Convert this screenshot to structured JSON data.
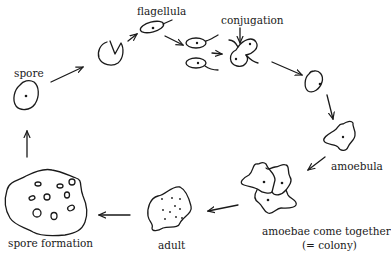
{
  "diagram": {
    "type": "life-cycle",
    "ink_color": "#1a1a1a",
    "background": "#ffffff",
    "stages": [
      {
        "id": "spore",
        "label": "spore"
      },
      {
        "id": "opening-spore",
        "label": ""
      },
      {
        "id": "flagellula",
        "label": "flagellula"
      },
      {
        "id": "conjugation",
        "label": "conjugation"
      },
      {
        "id": "zygote",
        "label": ""
      },
      {
        "id": "amoebula",
        "label": "amoebula"
      },
      {
        "id": "colony",
        "label": "amoebae come together",
        "sublabel": "(= colony)"
      },
      {
        "id": "adult",
        "label": "adult"
      },
      {
        "id": "spore-formation",
        "label": "spore formation"
      }
    ],
    "flow": [
      "spore",
      "opening-spore",
      "flagellula",
      "conjugation",
      "zygote",
      "amoebula",
      "colony",
      "adult",
      "spore-formation",
      "spore"
    ]
  }
}
